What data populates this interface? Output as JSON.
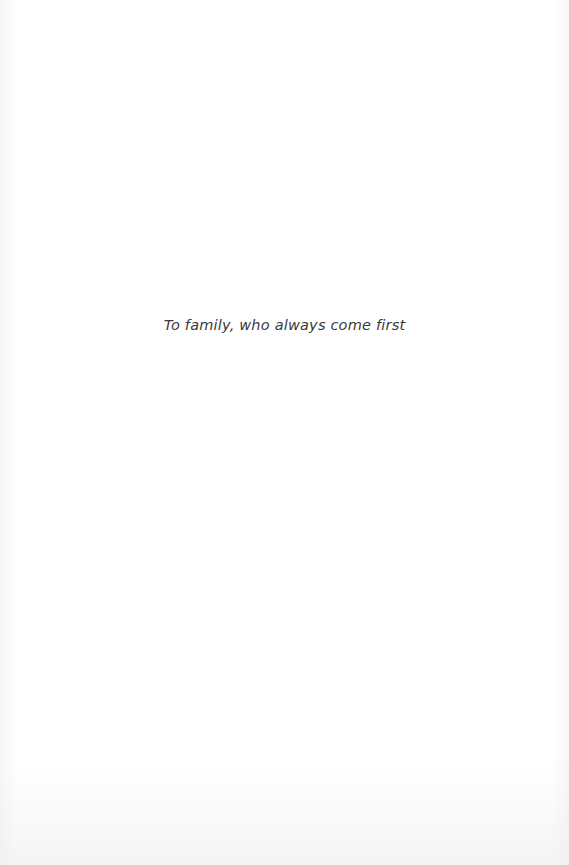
{
  "page": {
    "type": "dedication",
    "dedication_text": "To family, who always come first"
  }
}
